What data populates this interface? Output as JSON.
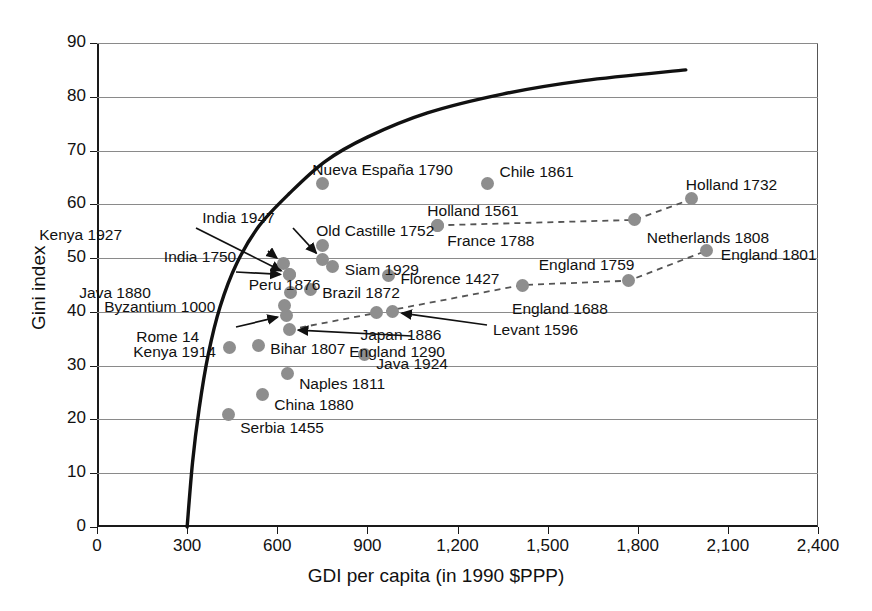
{
  "chart_data": {
    "type": "scatter",
    "title": "",
    "xlabel": "GDI per capita (in 1990 $PPP)",
    "ylabel": "Gini index",
    "xlim": [
      0,
      2400
    ],
    "ylim": [
      0,
      90
    ],
    "xticks": [
      "0",
      "300",
      "600",
      "900",
      "1,200",
      "1,500",
      "1,800",
      "2,100",
      "2,400"
    ],
    "xtick_values": [
      0,
      300,
      600,
      900,
      1200,
      1500,
      1800,
      2100,
      2400
    ],
    "yticks": [
      "0",
      "10",
      "20",
      "30",
      "40",
      "50",
      "60",
      "70",
      "80",
      "90"
    ],
    "ytick_values": [
      0,
      10,
      20,
      30,
      40,
      50,
      60,
      70,
      80,
      90
    ],
    "grid": "horizontal",
    "legend": "none",
    "marker_color": "#8e8e8e",
    "frontier_color": "#111111",
    "connector_color": "#555555",
    "points": [
      {
        "name": "Serbia 1455",
        "x": 437,
        "y": 21,
        "label_dx": 12,
        "label_dy": 14
      },
      {
        "name": "Kenya 1914",
        "x": 440,
        "y": 33.3,
        "label_dx": -96,
        "label_dy": 4
      },
      {
        "name": "China 1880",
        "x": 550,
        "y": 24.6,
        "label_dx": 12,
        "label_dy": 10
      },
      {
        "name": "Bihar 1807",
        "x": 537,
        "y": 33.8,
        "label_dx": 12,
        "label_dy": 4
      },
      {
        "name": "Naples 1811",
        "x": 633,
        "y": 28.5,
        "label_dx": 12,
        "label_dy": 10
      },
      {
        "name": "Java 1924",
        "x": 890,
        "y": 32.1,
        "label_dx": 12,
        "label_dy": 10
      },
      {
        "name": "Rome 14",
        "x": 630,
        "y": 39.4,
        "label_dx": -150,
        "label_dy": 22
      },
      {
        "name": "Byzantium 1000",
        "x": 623,
        "y": 41.2,
        "label_dx": -180,
        "label_dy": 2
      },
      {
        "name": "England 1290",
        "x": 640,
        "y": 36.7,
        "label_dx": 60,
        "label_dy": 22
      },
      {
        "name": "Japan 1886",
        "x": 930,
        "y": 39.8,
        "label_dx": -16,
        "label_dy": 22
      },
      {
        "name": "Levant 1596",
        "x": 985,
        "y": 40.0,
        "label_dx": 100,
        "label_dy": 18
      },
      {
        "name": "Java 1880",
        "x": 640,
        "y": 46.9,
        "label_dx": -210,
        "label_dy": 18
      },
      {
        "name": "Peru 1876",
        "x": 645,
        "y": 43.6,
        "label_dx": -42,
        "label_dy": -8
      },
      {
        "name": "Brazil 1872",
        "x": 710,
        "y": 44.2,
        "label_dx": 12,
        "label_dy": 4
      },
      {
        "name": "India 1750",
        "x": 622,
        "y": 49.0,
        "label_dx": -120,
        "label_dy": -6
      },
      {
        "name": "India 1947",
        "x": 750,
        "y": 49.7,
        "label_dx": -120,
        "label_dy": -42
      },
      {
        "name": "Kenya 1927",
        "x": 640,
        "y": 46.9,
        "label_dx": -250,
        "label_dy": -40
      },
      {
        "name": "Siam 1929",
        "x": 785,
        "y": 48.5,
        "label_dx": 12,
        "label_dy": 4
      },
      {
        "name": "Florence 1427",
        "x": 970,
        "y": 46.8,
        "label_dx": 12,
        "label_dy": 4
      },
      {
        "name": "Old Castille 1752",
        "x": 750,
        "y": 52.4,
        "label_dx": -6,
        "label_dy": -14
      },
      {
        "name": "Holland 1561",
        "x": 1133,
        "y": 56.1,
        "label_dx": -10,
        "label_dy": -14
      },
      {
        "name": "France 1788",
        "x": 1133,
        "y": 56.1,
        "label_dx": 10,
        "label_dy": 16
      },
      {
        "name": "Nueva España 1790",
        "x": 750,
        "y": 63.8,
        "label_dx": -10,
        "label_dy": -14
      },
      {
        "name": "Chile 1861",
        "x": 1300,
        "y": 63.8,
        "label_dx": 12,
        "label_dy": -12
      },
      {
        "name": "England 1688",
        "x": 1415,
        "y": 45.0,
        "label_dx": -10,
        "label_dy": 24
      },
      {
        "name": "England 1759",
        "x": 1770,
        "y": 45.8,
        "label_dx": -90,
        "label_dy": -16
      },
      {
        "name": "England 1801",
        "x": 2030,
        "y": 51.4,
        "label_dx": 14,
        "label_dy": 4
      },
      {
        "name": "Netherlands 1808",
        "x": 1790,
        "y": 57.1,
        "label_dx": 12,
        "label_dy": 18
      },
      {
        "name": "Holland 1732",
        "x": 1980,
        "y": 61.0,
        "label_dx": -6,
        "label_dy": -14
      }
    ],
    "connector_series": [
      {
        "name": "netherlands-series",
        "points": [
          "Holland 1561",
          "Netherlands 1808",
          "Holland 1732"
        ]
      },
      {
        "name": "england-series",
        "points": [
          "England 1290",
          "England 1688",
          "England 1759",
          "England 1801"
        ]
      }
    ],
    "frontier_curve": {
      "name": "inequality-possibility-frontier",
      "note": "solid black concave curve rising from x=300,y=0 to x~1960,y~85",
      "points": [
        {
          "x": 300,
          "y": 0
        },
        {
          "x": 318,
          "y": 12
        },
        {
          "x": 340,
          "y": 22
        },
        {
          "x": 370,
          "y": 32
        },
        {
          "x": 410,
          "y": 41
        },
        {
          "x": 465,
          "y": 49
        },
        {
          "x": 540,
          "y": 56
        },
        {
          "x": 640,
          "y": 62
        },
        {
          "x": 760,
          "y": 68
        },
        {
          "x": 900,
          "y": 72.5
        },
        {
          "x": 1100,
          "y": 77
        },
        {
          "x": 1350,
          "y": 80.5
        },
        {
          "x": 1620,
          "y": 83
        },
        {
          "x": 1960,
          "y": 85
        }
      ]
    },
    "annotation_arrows": [
      {
        "name": "kenya-1927-arrow",
        "from_label": "Kenya 1927",
        "to_point": "Kenya 1927"
      },
      {
        "name": "india-1947-arrow",
        "from_label": "India 1947",
        "to_point": "India 1947"
      },
      {
        "name": "india-1750-arrow",
        "from_label": "India 1750",
        "to_point": "India 1750"
      },
      {
        "name": "java-1880-arrow",
        "from_label": "Java 1880",
        "to_point": "Java 1880"
      },
      {
        "name": "rome-14-arrow",
        "from_label": "Rome 14",
        "to_point": "Rome 14"
      },
      {
        "name": "levant-1596-arrow",
        "from_label": "Levant 1596",
        "to_point": "Levant 1596"
      },
      {
        "name": "england-1290-arrow",
        "from_label": "England 1290",
        "to_point": "England 1290"
      }
    ]
  }
}
